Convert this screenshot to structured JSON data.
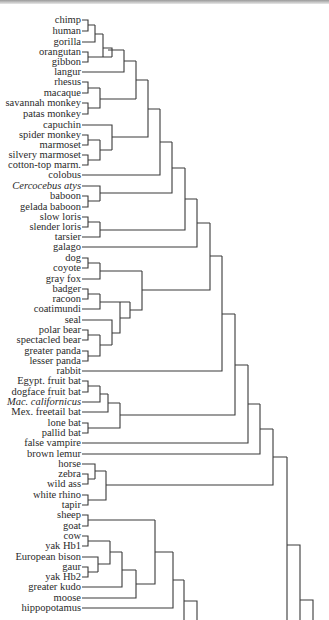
{
  "figure": {
    "type": "dendrogram",
    "leaves": [
      {
        "label": "chimp",
        "y": 20,
        "italic": false
      },
      {
        "label": "human",
        "y": 31,
        "italic": false
      },
      {
        "label": "gorilla",
        "y": 42,
        "italic": false
      },
      {
        "label": "orangutan",
        "y": 52,
        "italic": false
      },
      {
        "label": "gibbon",
        "y": 62,
        "italic": false
      },
      {
        "label": "langur",
        "y": 72,
        "italic": false
      },
      {
        "label": "rhesus",
        "y": 82,
        "italic": false
      },
      {
        "label": "macaque",
        "y": 93,
        "italic": false
      },
      {
        "label": "savannah monkey",
        "y": 103,
        "italic": false
      },
      {
        "label": "patas monkey",
        "y": 114,
        "italic": false
      },
      {
        "label": "capuchin",
        "y": 125,
        "italic": false
      },
      {
        "label": "spider monkey",
        "y": 135,
        "italic": false
      },
      {
        "label": "marmoset",
        "y": 145,
        "italic": false
      },
      {
        "label": "silvery marmoset",
        "y": 155,
        "italic": false
      },
      {
        "label": "cotton-top marm.",
        "y": 165,
        "italic": false
      },
      {
        "label": "colobus",
        "y": 175,
        "italic": false
      },
      {
        "label": "Cercocebus atys",
        "y": 186,
        "italic": true
      },
      {
        "label": "baboon",
        "y": 196,
        "italic": false
      },
      {
        "label": "gelada baboon",
        "y": 207,
        "italic": false
      },
      {
        "label": "slow loris",
        "y": 217,
        "italic": false
      },
      {
        "label": "slender loris",
        "y": 227,
        "italic": false
      },
      {
        "label": "tarsier",
        "y": 237,
        "italic": false
      },
      {
        "label": "galago",
        "y": 247,
        "italic": false
      },
      {
        "label": "dog",
        "y": 258,
        "italic": false
      },
      {
        "label": "coyote",
        "y": 268,
        "italic": false
      },
      {
        "label": "gray fox",
        "y": 279,
        "italic": false
      },
      {
        "label": "badger",
        "y": 289,
        "italic": false
      },
      {
        "label": "racoon",
        "y": 299,
        "italic": false
      },
      {
        "label": "coatimundi",
        "y": 309,
        "italic": false
      },
      {
        "label": "seal",
        "y": 320,
        "italic": false
      },
      {
        "label": "polar bear",
        "y": 330,
        "italic": false
      },
      {
        "label": "spectacled bear",
        "y": 340,
        "italic": false
      },
      {
        "label": "greater panda",
        "y": 351,
        "italic": false
      },
      {
        "label": "lesser panda",
        "y": 361,
        "italic": false
      },
      {
        "label": "rabbit",
        "y": 371,
        "italic": false
      },
      {
        "label": "Egypt. fruit bat",
        "y": 381,
        "italic": false
      },
      {
        "label": "dogface fruit bat",
        "y": 392,
        "italic": false
      },
      {
        "label": "Mac. californicus",
        "y": 402,
        "italic": true
      },
      {
        "label": "Mex. freetail bat",
        "y": 412,
        "italic": false
      },
      {
        "label": "lone bat",
        "y": 423,
        "italic": false
      },
      {
        "label": "pallid bat",
        "y": 433,
        "italic": false
      },
      {
        "label": "false vampire",
        "y": 443,
        "italic": false
      },
      {
        "label": "brown lemur",
        "y": 454,
        "italic": false
      },
      {
        "label": "horse",
        "y": 464,
        "italic": false
      },
      {
        "label": "zebra",
        "y": 474,
        "italic": false
      },
      {
        "label": "wild ass",
        "y": 484,
        "italic": false
      },
      {
        "label": "white rhino",
        "y": 495,
        "italic": false
      },
      {
        "label": "tapir",
        "y": 505,
        "italic": false
      },
      {
        "label": "sheep",
        "y": 515,
        "italic": false
      },
      {
        "label": "goat",
        "y": 526,
        "italic": false
      },
      {
        "label": "cow",
        "y": 536,
        "italic": false
      },
      {
        "label": "yak Hb1",
        "y": 546,
        "italic": false
      },
      {
        "label": "European bison",
        "y": 557,
        "italic": false
      },
      {
        "label": "gaur",
        "y": 567,
        "italic": false
      },
      {
        "label": "yak Hb2",
        "y": 577,
        "italic": false
      },
      {
        "label": "greater kudo",
        "y": 587,
        "italic": false
      },
      {
        "label": "moose",
        "y": 598,
        "italic": false
      },
      {
        "label": "hippopotamus",
        "y": 608,
        "italic": false
      }
    ],
    "line_color": "#3a3a3a",
    "text_color": "#2a2a2a"
  }
}
